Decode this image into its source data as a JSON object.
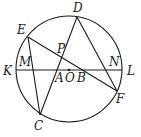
{
  "diagram": {
    "type": "geometry-circle",
    "circle": {
      "center": "O",
      "cx": 69,
      "cy": 69,
      "r": 53
    },
    "points": {
      "D": {
        "x": 77,
        "y": 17,
        "label": "D",
        "lx": 73,
        "ly": 12
      },
      "E": {
        "x": 28,
        "y": 37,
        "label": "E",
        "lx": 17,
        "ly": 34
      },
      "K": {
        "x": 16,
        "y": 70,
        "label": "K",
        "lx": 3,
        "ly": 75
      },
      "L": {
        "x": 122,
        "y": 70,
        "label": "L",
        "lx": 127,
        "ly": 75
      },
      "F": {
        "x": 117,
        "y": 91,
        "label": "F",
        "lx": 116,
        "ly": 103
      },
      "C": {
        "x": 40,
        "y": 115,
        "label": "C",
        "lx": 34,
        "ly": 130
      },
      "M": {
        "x": 32,
        "y": 70,
        "label": "M",
        "lx": 19,
        "ly": 66
      },
      "P": {
        "x": 62,
        "y": 58,
        "label": "P",
        "lx": 57,
        "ly": 53
      },
      "N": {
        "x": 107,
        "y": 70,
        "label": "N",
        "lx": 109,
        "ly": 66
      },
      "A": {
        "x": 58,
        "y": 70,
        "label": "A",
        "lx": 55,
        "ly": 82
      },
      "O": {
        "x": 69,
        "y": 70,
        "label": "O",
        "lx": 65,
        "ly": 82
      },
      "B": {
        "x": 80,
        "y": 70,
        "label": "B",
        "lx": 77,
        "ly": 82
      }
    },
    "segments": [
      [
        "K",
        "L"
      ],
      [
        "E",
        "F"
      ],
      [
        "E",
        "C"
      ],
      [
        "C",
        "D"
      ],
      [
        "D",
        "F"
      ]
    ]
  }
}
